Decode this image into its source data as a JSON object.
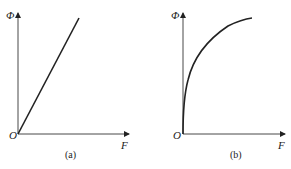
{
  "figure": {
    "panels": [
      {
        "id": "a",
        "caption": "(a)",
        "y_axis_label": "Φ",
        "x_axis_label": "F",
        "origin_label": "O",
        "curve_type": "linear"
      },
      {
        "id": "b",
        "caption": "(b)",
        "y_axis_label": "Φ",
        "x_axis_label": "F",
        "origin_label": "O",
        "curve_type": "saturating"
      }
    ],
    "colors": {
      "line": "#222222",
      "background": "#ffffff"
    }
  }
}
